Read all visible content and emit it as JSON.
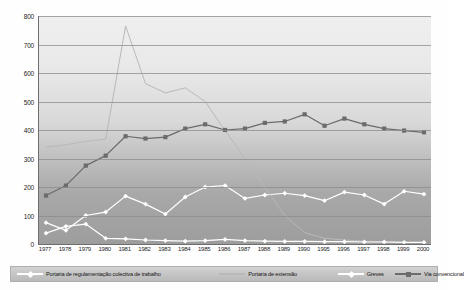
{
  "chart_data": {
    "type": "line",
    "title": "",
    "subtitle": "",
    "xlabel": "",
    "ylabel": "",
    "ylim": [
      0,
      800
    ],
    "ytick_step": 100,
    "yticks": [
      0,
      100,
      200,
      300,
      400,
      500,
      600,
      700,
      800
    ],
    "grid": true,
    "legend_position": "bottom",
    "axis_note": "x axis skips years 1991-1994",
    "categories": [
      "1977",
      "1978",
      "1979",
      "1980",
      "1981",
      "1982",
      "1983",
      "1984",
      "1985",
      "1986",
      "1987",
      "1988",
      "1989",
      "1990",
      "1995",
      "1996",
      "1997",
      "1998",
      "1999",
      "2000"
    ],
    "series": [
      {
        "name": "Portaria de regulamentação colectiva de trabalho",
        "color": "#ffffff",
        "marker": "diamond",
        "values": [
          75,
          48,
          100,
          112,
          168,
          140,
          105,
          165,
          200,
          205,
          160,
          172,
          178,
          170,
          152,
          182,
          172,
          140,
          185,
          175
        ]
      },
      {
        "name": "Portaria de extensão",
        "color": "#b9b9b9",
        "marker": "none",
        "values": [
          340,
          348,
          360,
          368,
          765,
          563,
          530,
          548,
          500,
          398,
          300,
          200,
          100,
          40,
          20,
          14,
          10,
          8,
          6,
          5
        ]
      },
      {
        "name": "Greves",
        "color": "#ffffff",
        "marker": "diamond",
        "values": [
          38,
          62,
          70,
          20,
          18,
          14,
          12,
          10,
          12,
          16,
          12,
          10,
          9,
          9,
          8,
          8,
          7,
          7,
          6,
          6
        ]
      },
      {
        "name": "Via convencional",
        "color": "#6b6b6b",
        "marker": "square",
        "values": [
          170,
          205,
          275,
          310,
          378,
          370,
          375,
          405,
          420,
          400,
          405,
          425,
          430,
          455,
          415,
          440,
          420,
          405,
          398,
          392
        ]
      }
    ]
  },
  "legend": {
    "items": [
      {
        "label": "Portaria de regulamentação colectiva de trabalho"
      },
      {
        "label": "Portaria de extensão"
      },
      {
        "label": "Greves"
      },
      {
        "label": "Via convencional"
      }
    ]
  }
}
